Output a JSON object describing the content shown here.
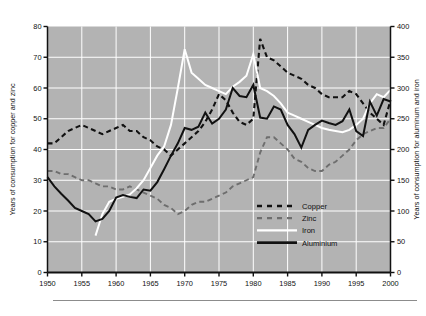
{
  "figure": {
    "background_color": "#ffffff",
    "plot_background_color": "#b3b3b3",
    "gridline_color": "#ffffff",
    "axis_color": "#111111"
  },
  "axes": {
    "left_title": "Years of consumption for copper and zinc",
    "right_title": "Years of consumption for aluminum and iron",
    "x_ticks": [
      "1950",
      "1955",
      "1960",
      "1965",
      "1970",
      "1975",
      "1980",
      "1985",
      "1990",
      "1995",
      "2000"
    ],
    "left_ticks": [
      "0",
      "10",
      "20",
      "30",
      "40",
      "50",
      "60",
      "70",
      "80"
    ],
    "right_ticks": [
      "0",
      "50",
      "100",
      "150",
      "200",
      "250",
      "300",
      "350",
      "400"
    ]
  },
  "legend": {
    "items": [
      {
        "label": "Copper",
        "style": "dashed",
        "color": "#111111"
      },
      {
        "label": "Zinc",
        "style": "dashed",
        "color": "#6e6e6e"
      },
      {
        "label": "Iron",
        "style": "solid",
        "color": "#ffffff"
      },
      {
        "label": "Aluminium",
        "style": "solid",
        "color": "#111111"
      }
    ]
  },
  "chart_data": {
    "type": "line",
    "title": "",
    "xlabel": "",
    "ylabel": "Years of consumption for copper and zinc",
    "y2label": "Years of consumption for aluminum and iron",
    "xlim": [
      1950,
      2000
    ],
    "ylim": [
      0,
      80
    ],
    "y2lim": [
      0,
      400
    ],
    "grid": true,
    "legend_position": "lower-right-inside",
    "x": [
      1950,
      1951,
      1952,
      1953,
      1954,
      1955,
      1956,
      1957,
      1958,
      1959,
      1960,
      1961,
      1962,
      1963,
      1964,
      1965,
      1966,
      1967,
      1968,
      1969,
      1970,
      1971,
      1972,
      1973,
      1974,
      1975,
      1976,
      1977,
      1978,
      1979,
      1980,
      1981,
      1982,
      1983,
      1984,
      1985,
      1986,
      1987,
      1988,
      1989,
      1990,
      1991,
      1992,
      1993,
      1994,
      1995,
      1996,
      1997,
      1998,
      1999,
      2000
    ],
    "series": [
      {
        "name": "Copper",
        "axis": "left",
        "units": "years of consumption",
        "color": "#111111",
        "style": "dashed",
        "values": [
          42,
          42,
          44,
          46,
          47,
          48,
          47,
          46,
          45,
          46,
          47,
          48,
          46,
          46,
          44,
          43,
          41,
          40,
          38,
          40,
          42,
          44,
          46,
          49,
          53,
          58,
          56,
          52,
          49,
          48,
          50,
          76,
          70,
          69,
          67,
          65,
          64,
          63,
          61,
          60,
          58,
          57,
          57,
          57,
          59,
          58,
          55,
          52,
          50,
          48,
          56
        ]
      },
      {
        "name": "Zinc",
        "axis": "left",
        "units": "years of consumption",
        "color": "#6e6e6e",
        "style": "dashed",
        "values": [
          33,
          33,
          32,
          32,
          31,
          30,
          30,
          29,
          28,
          28,
          27,
          27,
          28,
          27,
          26,
          25,
          24,
          22,
          21,
          19,
          20,
          22,
          23,
          23,
          24,
          25,
          26,
          28,
          29,
          30,
          31,
          39,
          44,
          44,
          42,
          40,
          37,
          36,
          34,
          33,
          33,
          35,
          36,
          38,
          40,
          43,
          45,
          46,
          47,
          47,
          50
        ]
      },
      {
        "name": "Iron",
        "axis": "right",
        "units": "years of consumption",
        "color": "#ffffff",
        "style": "solid",
        "values": [
          null,
          null,
          null,
          null,
          null,
          null,
          null,
          60,
          95,
          115,
          120,
          123,
          127,
          137,
          150,
          170,
          190,
          205,
          240,
          300,
          363,
          325,
          315,
          305,
          300,
          295,
          290,
          302,
          310,
          320,
          355,
          300,
          295,
          287,
          275,
          260,
          255,
          250,
          245,
          240,
          235,
          232,
          230,
          228,
          232,
          240,
          250,
          275,
          290,
          285,
          297
        ]
      },
      {
        "name": "Aluminium",
        "axis": "right",
        "units": "years of consumption",
        "color": "#111111",
        "style": "solid",
        "values": [
          155,
          140,
          128,
          117,
          105,
          100,
          95,
          83,
          87,
          100,
          122,
          126,
          123,
          121,
          135,
          133,
          147,
          168,
          190,
          210,
          235,
          232,
          237,
          260,
          242,
          250,
          265,
          300,
          287,
          285,
          305,
          252,
          250,
          270,
          265,
          240,
          225,
          203,
          232,
          240,
          247,
          243,
          240,
          246,
          265,
          230,
          222,
          278,
          255,
          282,
          278
        ]
      }
    ]
  }
}
